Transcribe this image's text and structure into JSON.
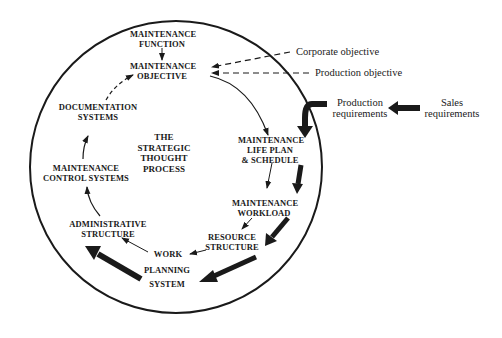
{
  "diagram": {
    "title": "THE STRATEGIC THOUGHT PROCESS",
    "colors": {
      "ink": "#1a1a1a",
      "background": "#ffffff"
    },
    "center_label": "THE\nSTRATEGIC\nTHOUGHT\nPROCESS",
    "nodes": {
      "maintenance_function": "MAINTENANCE\nFUNCTION",
      "maintenance_objective": "MAINTENANCE\nOBJECTIVE",
      "life_plan": "MAINTENANCE\nLIFE PLAN\n& SCHEDULE",
      "workload": "MAINTENANCE\nWORKLOAD",
      "resource_structure": "RESOURCE\nSTRUCTURE",
      "work_planning_system_1": "WORK",
      "work_planning_system_2": "PLANNING",
      "work_planning_system_3": "SYSTEM",
      "administrative_structure": "ADMINISTRATIVE\nSTRUCTURE",
      "control_systems": "MAINTENANCE\nCONTROL SYSTEMS",
      "documentation_systems": "DOCUMENTATION\nSYSTEMS"
    },
    "external_inputs": {
      "corporate_objective": "Corporate objective",
      "production_objective": "Production objective",
      "production_requirements": "Production\nrequirements",
      "sales_requirements": "Sales\nrequirements"
    },
    "edges": [
      {
        "from": "Maintenance function",
        "to": "Maintenance objective",
        "style": "thin"
      },
      {
        "from": "Corporate objective",
        "to": "Maintenance objective",
        "style": "dashed"
      },
      {
        "from": "Production objective",
        "to": "Maintenance objective",
        "style": "dashed"
      },
      {
        "from": "Maintenance objective",
        "to": "Maintenance life plan & schedule",
        "style": "thin"
      },
      {
        "from": "Sales requirements",
        "to": "Production requirements",
        "style": "thick"
      },
      {
        "from": "Production requirements",
        "to": "Maintenance life plan & schedule",
        "style": "thick"
      },
      {
        "from": "Maintenance life plan & schedule",
        "to": "Maintenance workload",
        "style": "thin+thick"
      },
      {
        "from": "Maintenance workload",
        "to": "Resource structure",
        "style": "thin+thick"
      },
      {
        "from": "Resource structure",
        "to": "Work planning system",
        "style": "thin+thick"
      },
      {
        "from": "Work planning system",
        "to": "Administrative structure",
        "style": "thin+thick"
      },
      {
        "from": "Administrative structure",
        "to": "Maintenance control systems",
        "style": "thin"
      },
      {
        "from": "Maintenance control systems",
        "to": "Documentation systems",
        "style": "thin"
      },
      {
        "from": "Documentation systems",
        "to": "Maintenance objective",
        "style": "dashed"
      }
    ]
  }
}
